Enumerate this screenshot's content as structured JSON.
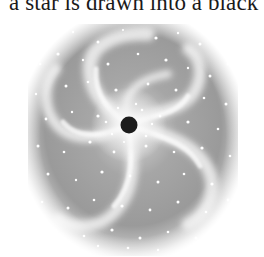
{
  "document": {
    "caption_line": "a star is drawn into a black hole."
  },
  "figure": {
    "icons": {
      "black_hole": "black-hole-icon",
      "galaxy": "spiral-galaxy-icon"
    },
    "colors": {
      "background_fade": "#ffffff",
      "disk_gray": "#9a9a9a",
      "arm_light": "#e8e8e8",
      "star": "#ffffff",
      "black_hole": "#1c1c1c"
    }
  }
}
